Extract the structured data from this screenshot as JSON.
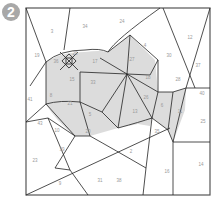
{
  "badge": {
    "number": "2"
  },
  "colors": {
    "shade": "#dcdcdc",
    "line": "#222222",
    "frame": "#555555",
    "label": "#999999",
    "badge": "#a8a8a8"
  },
  "regions": [
    {
      "id": "r3",
      "label": "3",
      "x": 52,
      "y": 32
    },
    {
      "id": "r34",
      "label": "34",
      "x": 85,
      "y": 27
    },
    {
      "id": "r24",
      "label": "24",
      "x": 122,
      "y": 22
    },
    {
      "id": "r4",
      "label": "4",
      "x": 145,
      "y": 46
    },
    {
      "id": "r12",
      "label": "12",
      "x": 190,
      "y": 38
    },
    {
      "id": "r19",
      "label": "19",
      "x": 37,
      "y": 56
    },
    {
      "id": "r29",
      "label": "29",
      "x": 75,
      "y": 54
    },
    {
      "id": "r36",
      "label": "36",
      "x": 56,
      "y": 62
    },
    {
      "id": "r17",
      "label": "17",
      "x": 95,
      "y": 62
    },
    {
      "id": "r27",
      "label": "27",
      "x": 132,
      "y": 60
    },
    {
      "id": "r30",
      "label": "30",
      "x": 169,
      "y": 56
    },
    {
      "id": "r37",
      "label": "37",
      "x": 198,
      "y": 66
    },
    {
      "id": "r15",
      "label": "15",
      "x": 72,
      "y": 80
    },
    {
      "id": "r33",
      "label": "33",
      "x": 93,
      "y": 83
    },
    {
      "id": "r18",
      "label": "18",
      "x": 148,
      "y": 78
    },
    {
      "id": "r8",
      "label": "8",
      "x": 51,
      "y": 96
    },
    {
      "id": "r21",
      "label": "21",
      "x": 70,
      "y": 104
    },
    {
      "id": "r28",
      "label": "28",
      "x": 178,
      "y": 80
    },
    {
      "id": "r26",
      "label": "26",
      "x": 146,
      "y": 98
    },
    {
      "id": "r6",
      "label": "6",
      "x": 162,
      "y": 106
    },
    {
      "id": "r41",
      "label": "41",
      "x": 30,
      "y": 100
    },
    {
      "id": "r11",
      "label": "11",
      "x": 180,
      "y": 112
    },
    {
      "id": "r40",
      "label": "40",
      "x": 202,
      "y": 94
    },
    {
      "id": "r13",
      "label": "13",
      "x": 135,
      "y": 112
    },
    {
      "id": "r25",
      "label": "25",
      "x": 203,
      "y": 122
    },
    {
      "id": "r43",
      "label": "43",
      "x": 40,
      "y": 124
    },
    {
      "id": "r5",
      "label": "5",
      "x": 90,
      "y": 115
    },
    {
      "id": "r10",
      "label": "10",
      "x": 57,
      "y": 131
    },
    {
      "id": "r20",
      "label": "20",
      "x": 88,
      "y": 132
    },
    {
      "id": "r35",
      "label": "35",
      "x": 157,
      "y": 132
    },
    {
      "id": "r39",
      "label": "39",
      "x": 62,
      "y": 150
    },
    {
      "id": "r2",
      "label": "2",
      "x": 131,
      "y": 152
    },
    {
      "id": "r23",
      "label": "23",
      "x": 35,
      "y": 161
    },
    {
      "id": "r16",
      "label": "16",
      "x": 167,
      "y": 172
    },
    {
      "id": "r14",
      "label": "14",
      "x": 201,
      "y": 165
    },
    {
      "id": "r9",
      "label": "9",
      "x": 60,
      "y": 184
    },
    {
      "id": "r38",
      "label": "38",
      "x": 119,
      "y": 181
    },
    {
      "id": "r31",
      "label": "31",
      "x": 100,
      "y": 181
    }
  ]
}
